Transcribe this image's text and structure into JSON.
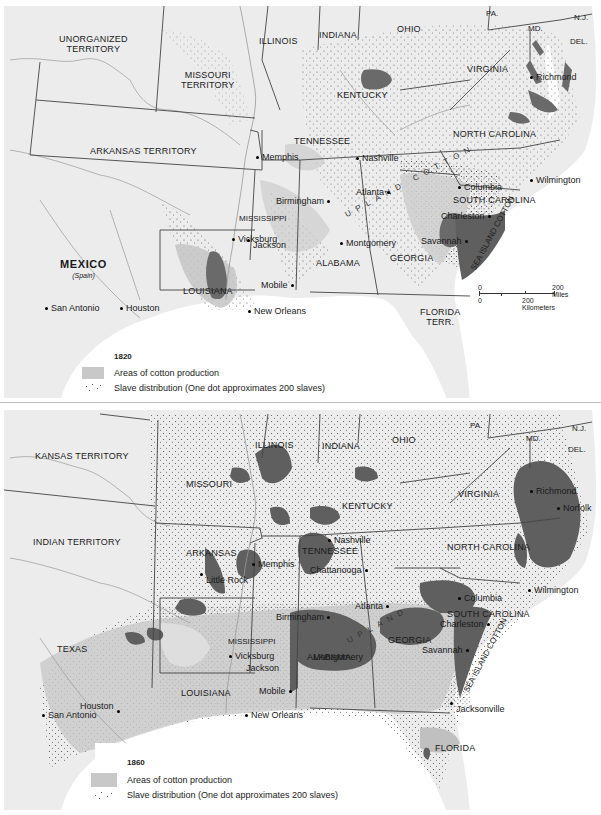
{
  "colors": {
    "land": "#ececec",
    "water": "#ffffff",
    "border": "#444444",
    "river": "#9a9a9a",
    "cotton_light": "#c8c8c8",
    "cotton_dark": "#6a6a6a",
    "dot": "#555555"
  },
  "map1820": {
    "year": "1820",
    "states": {
      "unorganized": "UNORGANIZED",
      "unorganized2": "TERRITORY",
      "missouri": "MISSOURI",
      "missouri2": "TERRITORY",
      "illinois": "ILLINOIS",
      "indiana": "INDIANA",
      "ohio": "OHIO",
      "pa": "PA.",
      "nj": "N.J.",
      "md": "MD.",
      "del": "DEL.",
      "virginia": "VIRGINIA",
      "kentucky": "KENTUCKY",
      "tennessee": "TENNESSEE",
      "north_carolina": "NORTH CAROLINA",
      "south_carolina": "SOUTH CAROLINA",
      "arkansas": "ARKANSAS TERRITORY",
      "mississippi": "MISSISSIPPI",
      "alabama": "ALABAMA",
      "georgia": "GEORGIA",
      "louisiana": "LOUISIANA",
      "florida": "FLORIDA",
      "florida2": "TERR.",
      "mexico": "MEXICO",
      "mexico_sub": "(Spain)"
    },
    "cities": {
      "nashville": "Nashville",
      "memphis": "Memphis",
      "richmond": "Richmond",
      "wilmington": "Wilmington",
      "columbia": "Columbia",
      "charleston": "Charleston",
      "savannah": "Savannah",
      "atlanta": "Atlanta",
      "birmingham": "Birmingham",
      "montgomery": "Montgomery",
      "vicksburg": "Vicksburg",
      "jackson": "Jackson",
      "mobile": "Mobile",
      "new_orleans": "New Orleans",
      "san_antonio": "San Antonio",
      "houston": "Houston"
    },
    "annotations": {
      "upland_cotton": "UPLAND COTTON",
      "sea_island_cotton": "SEA ISLAND COTTON"
    },
    "scale": {
      "zero_top": "0",
      "miles": "200 Miles",
      "zero_bottom": "0",
      "km": "200 Kilometers"
    },
    "legend": {
      "year": "1820",
      "cotton": "Areas of cotton production",
      "slave": "Slave distribution (One dot approximates 200 slaves)"
    }
  },
  "map1860": {
    "year": "1860",
    "states": {
      "kansas": "KANSAS TERRITORY",
      "indian": "INDIAN TERRITORY",
      "missouri": "MISSOURI",
      "illinois": "ILLINOIS",
      "indiana": "INDIANA",
      "ohio": "OHIO",
      "pa": "PA.",
      "nj": "N.J.",
      "md": "MD.",
      "del": "DEL.",
      "virginia": "VIRGINIA",
      "kentucky": "KENTUCKY",
      "tennessee": "TENNESSEE",
      "north_carolina": "NORTH CAROLINA",
      "south_carolina": "SOUTH CAROLINA",
      "arkansas": "ARKANSAS",
      "mississippi": "MISSISSIPPI",
      "alabama": "ALABAMA",
      "georgia": "GEORGIA",
      "louisiana": "LOUISIANA",
      "texas": "TEXAS",
      "florida": "FLORIDA"
    },
    "cities": {
      "richmond": "Richmond",
      "norfolk": "Norfolk",
      "nashville": "Nashville",
      "chattanooga": "Chattanooga",
      "memphis": "Memphis",
      "little_rock": "Little Rock",
      "wilmington": "Wilmington",
      "columbia": "Columbia",
      "charleston": "Charleston",
      "savannah": "Savannah",
      "atlanta": "Atlanta",
      "birmingham": "Birmingham",
      "montgomery": "Montgomery",
      "vicksburg": "Vicksburg",
      "jackson": "Jackson",
      "mobile": "Mobile",
      "new_orleans": "New Orleans",
      "houston": "Houston",
      "san_antonio": "San Antonio",
      "jacksonville": "Jacksonville"
    },
    "annotations": {
      "upland_cotton": "UPLAND",
      "sea_island_cotton": "SEA ISLAND COTTON"
    },
    "legend": {
      "year": "1860",
      "cotton": "Areas of cotton production",
      "slave": "Slave distribution (One dot approximates 200 slaves)"
    }
  }
}
